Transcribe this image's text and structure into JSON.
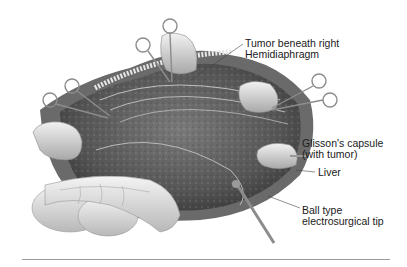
{
  "figure": {
    "labels": {
      "tumor_line1": "Tumor beneath right",
      "tumor_line2": "Hemidiaphragm",
      "glisson_line1": "Glisson's capsule",
      "glisson_line2": "(with tumor)",
      "liver": "Liver",
      "tip_line1": "Ball type",
      "tip_line2": "electrosurgical tip"
    },
    "colors": {
      "background": "#ffffff",
      "tissue_dark": "#4a4a4a",
      "tissue_mid": "#8a8a8a",
      "instrument": "#b0b0b0",
      "rule": "#9a9a9a"
    }
  }
}
